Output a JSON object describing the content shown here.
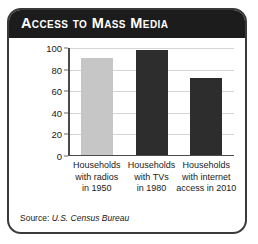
{
  "card": {
    "title": "Access to Mass Media",
    "source_prefix": "Source:",
    "source_name": "U.S. Census Bureau"
  },
  "chart_data": {
    "type": "bar",
    "title": "Access to Mass Media",
    "xlabel": "",
    "ylabel": "Households (%)",
    "ylim": [
      0,
      100
    ],
    "yticks": [
      0,
      20,
      40,
      60,
      80,
      100
    ],
    "grid": true,
    "legend": "none",
    "categories": [
      "Households with radios in 1950",
      "Households with TVs in 1980",
      "Households with internet access in 2010"
    ],
    "category_lines": [
      [
        "Households",
        "with radios",
        "in 1950"
      ],
      [
        "Households",
        "with TVs",
        "in 1980"
      ],
      [
        "Households",
        "with internet",
        "access in 2010"
      ]
    ],
    "values": [
      90,
      97,
      71
    ],
    "bar_colors": [
      "#c6c6c6",
      "#2d2d2d",
      "#2d2d2d"
    ]
  },
  "colors": {
    "header_bg": "#1c1c1c",
    "header_text": "#ffffff",
    "frame": "#3a3a3a",
    "grid": "#d4d4d4",
    "axis": "#4a4a4a",
    "bar_light": "#c6c6c6",
    "bar_dark": "#2d2d2d"
  }
}
